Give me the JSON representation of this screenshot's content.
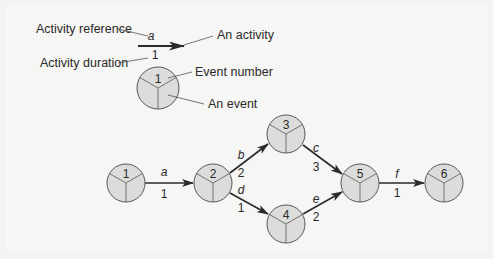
{
  "legend": {
    "activity_reference_label": "Activity reference",
    "activity_duration_label": "Activity duration",
    "an_activity_label": "An activity",
    "event_number_label": "Event number",
    "an_event_label": "An event",
    "sample_activity_ref": "a",
    "sample_activity_duration": "1",
    "sample_event_number": "1"
  },
  "network": {
    "nodes": [
      {
        "id": "1",
        "label": "1",
        "x": 126,
        "y": 183
      },
      {
        "id": "2",
        "label": "2",
        "x": 213,
        "y": 183
      },
      {
        "id": "3",
        "label": "3",
        "x": 286,
        "y": 134
      },
      {
        "id": "4",
        "label": "4",
        "x": 286,
        "y": 224
      },
      {
        "id": "5",
        "label": "5",
        "x": 360,
        "y": 183
      },
      {
        "id": "6",
        "label": "6",
        "x": 444,
        "y": 183
      }
    ],
    "activities": [
      {
        "ref": "a",
        "duration": "1",
        "from": "1",
        "to": "2"
      },
      {
        "ref": "b",
        "duration": "2",
        "from": "2",
        "to": "3"
      },
      {
        "ref": "d",
        "duration": "1",
        "from": "2",
        "to": "4"
      },
      {
        "ref": "c",
        "duration": "3",
        "from": "3",
        "to": "5"
      },
      {
        "ref": "e",
        "duration": "2",
        "from": "4",
        "to": "5"
      },
      {
        "ref": "f",
        "duration": "1",
        "from": "5",
        "to": "6"
      }
    ]
  },
  "colors": {
    "node_fill": "#dcdcda",
    "stroke": "#555555",
    "arrow": "#2a2a2a",
    "background": "#f5f5f3"
  }
}
